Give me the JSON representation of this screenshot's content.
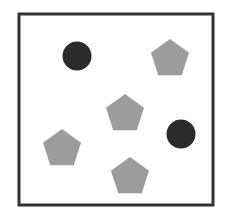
{
  "diagram": {
    "colors": {
      "background": "#ffffff",
      "border": "#333333",
      "circle": "#2b2b2b",
      "pentagon": "#9c9c9c"
    },
    "frame": {
      "x": 19,
      "y": 14,
      "width": 194,
      "height": 191,
      "stroke_width": 3
    },
    "shapes": [
      {
        "type": "circle",
        "label": "dark-circle",
        "cx": 77,
        "cy": 56,
        "r": 14.5
      },
      {
        "type": "pentagon",
        "label": "gray-pentagon",
        "cx": 170,
        "cy": 59,
        "r": 20
      },
      {
        "type": "pentagon",
        "label": "gray-pentagon",
        "cx": 125,
        "cy": 114,
        "r": 20
      },
      {
        "type": "circle",
        "label": "dark-circle",
        "cx": 181,
        "cy": 134,
        "r": 14.5
      },
      {
        "type": "pentagon",
        "label": "gray-pentagon",
        "cx": 62,
        "cy": 149,
        "r": 20
      },
      {
        "type": "pentagon",
        "label": "gray-pentagon",
        "cx": 130,
        "cy": 177,
        "r": 20
      }
    ],
    "counts": {
      "circles": 2,
      "pentagons": 4
    }
  }
}
